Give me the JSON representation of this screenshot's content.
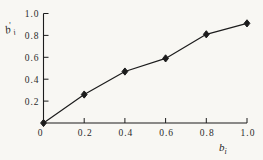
{
  "figure": {
    "background": "#f8f7f3",
    "ink": "#1c1c1c",
    "text_color": "#2a2a2a"
  },
  "labels": {
    "y_base": "b",
    "y_prime": "′",
    "y_sub": "i",
    "x_base": "b",
    "x_sub": "i"
  },
  "chart_data": {
    "type": "line",
    "title": "",
    "xlabel": "bᵢ",
    "ylabel": "b′ᵢ",
    "x": [
      0,
      0.2,
      0.4,
      0.6,
      0.8,
      1.0
    ],
    "series": [
      {
        "name": "b-prime vs b",
        "values": [
          0,
          0.26,
          0.47,
          0.59,
          0.81,
          0.91
        ],
        "marker": "filled-diamond",
        "color": "#1c1c1c"
      }
    ],
    "xlim": [
      0,
      1.0
    ],
    "ylim": [
      0,
      1.0
    ],
    "xticks": {
      "values": [
        0.2,
        0.4,
        0.6,
        0.8,
        1.0
      ],
      "labels": [
        "0.2",
        "0.4",
        "0.6",
        "0.8",
        "1.0"
      ]
    },
    "yticks": {
      "values": [
        0.2,
        0.4,
        0.6,
        0.8,
        1.0
      ],
      "labels": [
        "0.2",
        "0.4",
        "0.6",
        "0.8",
        "1.0"
      ]
    },
    "origin_label": "0",
    "grid": false,
    "legend": null,
    "frame": "L-shape (left and bottom axes only)"
  }
}
